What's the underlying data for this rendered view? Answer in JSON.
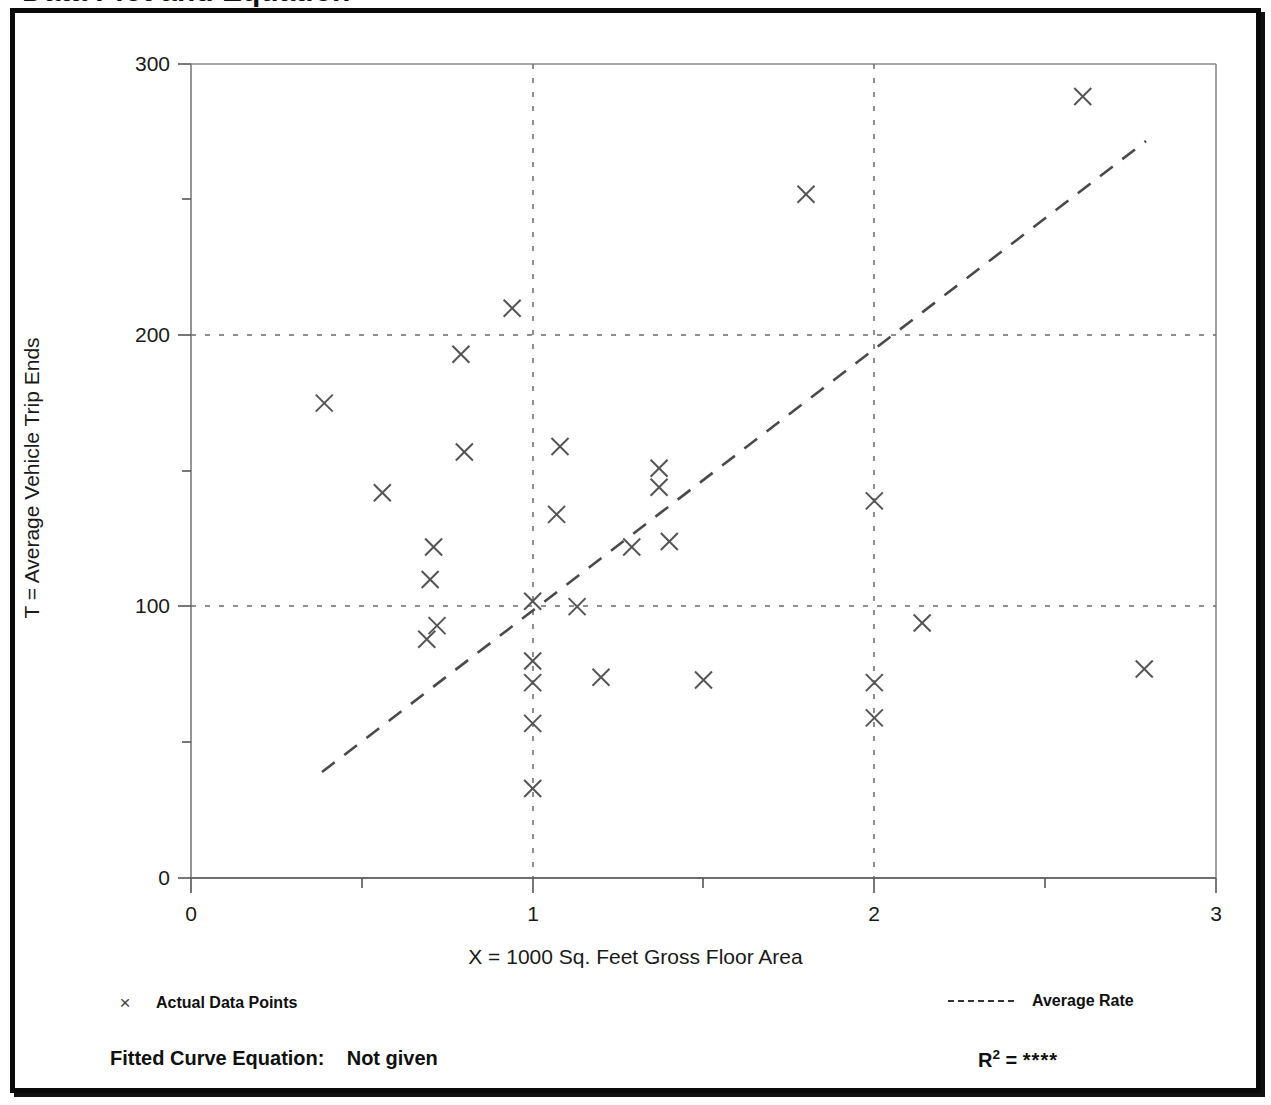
{
  "title": "Data Plot and Equation",
  "axes": {
    "xlabel": "X = 1000 Sq. Feet Gross Floor Area",
    "ylabel": "T = Average Vehicle Trip Ends",
    "xticks": [
      "0",
      "1",
      "2",
      "3"
    ],
    "yticks": [
      "0",
      "100",
      "200",
      "300"
    ]
  },
  "legend": {
    "marker_glyph": "×",
    "data_label": "Actual Data Points",
    "line_label": "Average Rate"
  },
  "equation": {
    "fitted_label": "Fitted Curve Equation:",
    "fitted_value": "Not given",
    "r2_label": "R",
    "r2_exponent": "2",
    "r2_eq": "=",
    "r2_value": "****"
  },
  "chart_data": {
    "type": "scatter",
    "title": "Data Plot and Equation",
    "xlabel": "X = 1000 Sq. Feet Gross Floor Area",
    "ylabel": "T = Average Vehicle Trip Ends",
    "xlim": [
      0,
      3
    ],
    "ylim": [
      0,
      300
    ],
    "xticks": [
      0,
      1,
      2,
      3
    ],
    "yticks": [
      0,
      100,
      200,
      300
    ],
    "xminor_ticks": [
      0.5,
      1.5,
      2.5
    ],
    "yminor_ticks": [
      50,
      150,
      250
    ],
    "grid": "dotted gridlines at y=100, y=200 and x=1, x=2",
    "legend_position": "below-plot",
    "series": [
      {
        "name": "Actual Data Points",
        "marker": "x",
        "points": [
          [
            0.39,
            175
          ],
          [
            0.56,
            142
          ],
          [
            0.71,
            122
          ],
          [
            0.7,
            110
          ],
          [
            0.69,
            88
          ],
          [
            0.72,
            93
          ],
          [
            0.79,
            193
          ],
          [
            0.8,
            157
          ],
          [
            0.94,
            210
          ],
          [
            1.0,
            102
          ],
          [
            1.0,
            80
          ],
          [
            1.0,
            72
          ],
          [
            1.0,
            57
          ],
          [
            1.0,
            33
          ],
          [
            1.08,
            159
          ],
          [
            1.07,
            134
          ],
          [
            1.13,
            100
          ],
          [
            1.2,
            74
          ],
          [
            1.29,
            122
          ],
          [
            1.37,
            151
          ],
          [
            1.37,
            144
          ],
          [
            1.4,
            124
          ],
          [
            1.5,
            73
          ],
          [
            1.8,
            252
          ],
          [
            2.0,
            139
          ],
          [
            2.0,
            72
          ],
          [
            2.0,
            59
          ],
          [
            2.14,
            94
          ],
          [
            2.61,
            288
          ],
          [
            2.79,
            77
          ]
        ]
      },
      {
        "name": "Average Rate",
        "type": "line",
        "style": "dashed",
        "x": [
          0.385,
          2.79
        ],
        "y": [
          40,
          270
        ]
      }
    ]
  }
}
